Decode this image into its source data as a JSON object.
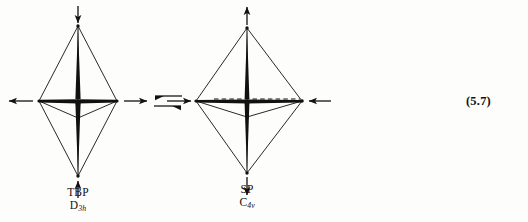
{
  "figure": {
    "name": "berry-pseudorotation",
    "equation_number": "(5.7)",
    "background_color": "#fdfdfc",
    "ink_color": "#111111"
  },
  "structures": [
    {
      "id": "tbp",
      "label_line1": "TBP",
      "label_symmetry_letter": "D",
      "label_symmetry_subscript": "3h",
      "geometry": "trigonal-bipyramidal",
      "center": {
        "x": 78,
        "y": 101
      },
      "vertices": {
        "apex_top": {
          "x": 78,
          "y": 26
        },
        "apex_bottom": {
          "x": 78,
          "y": 176
        },
        "equatorial_left": {
          "x": 39,
          "y": 101
        },
        "equatorial_right": {
          "x": 117,
          "y": 101
        },
        "equatorial_front": {
          "x": 78,
          "y": 118
        }
      },
      "arrows": [
        {
          "name": "arrow-top-inward",
          "direction": "down",
          "x": 78,
          "from_y": 6,
          "to_y": 24
        },
        {
          "name": "arrow-bottom-inward",
          "direction": "up",
          "x": 78,
          "from_y": 198,
          "to_y": 180
        },
        {
          "name": "arrow-left-outward",
          "direction": "left",
          "y": 101,
          "from_x": 33,
          "to_x": 8
        },
        {
          "name": "arrow-right-outward",
          "direction": "right",
          "y": 101,
          "from_x": 123,
          "to_x": 148
        }
      ]
    },
    {
      "id": "sp",
      "label_line1": "SP",
      "label_symmetry_letter": "C",
      "label_symmetry_subscript": "4v",
      "geometry": "square-pyramidal",
      "center": {
        "x": 247,
        "y": 101
      },
      "vertices": {
        "apex_top": {
          "x": 247,
          "y": 28
        },
        "apex_bottom": {
          "x": 247,
          "y": 173
        },
        "equatorial_left": {
          "x": 196,
          "y": 101
        },
        "equatorial_right": {
          "x": 302,
          "y": 101
        },
        "equatorial_front": {
          "x": 247,
          "y": 117
        }
      },
      "arrows": [
        {
          "name": "arrow-top-outward",
          "direction": "up",
          "x": 247,
          "from_y": 24,
          "to_y": 6
        },
        {
          "name": "arrow-bottom-outward",
          "direction": "down",
          "x": 247,
          "from_y": 177,
          "to_y": 196
        },
        {
          "name": "arrow-right-inward",
          "direction": "left",
          "y": 101,
          "from_x": 330,
          "to_x": 308
        }
      ]
    }
  ],
  "connector": {
    "name": "equilibrium-connector",
    "lead_in_arrow": {
      "from_x": 122,
      "to_x": 148,
      "y": 101,
      "direction": "right"
    },
    "equilibrium_symbol": "⇌",
    "harpoon_top": {
      "from_x": 182,
      "to_x": 154,
      "y": 96,
      "direction": "left"
    },
    "harpoon_bottom": {
      "from_x": 154,
      "to_x": 182,
      "y": 106,
      "direction": "right"
    },
    "lead_out_arrow": {
      "from_x": 166,
      "to_x": 192,
      "y": 101,
      "direction": "right"
    }
  }
}
